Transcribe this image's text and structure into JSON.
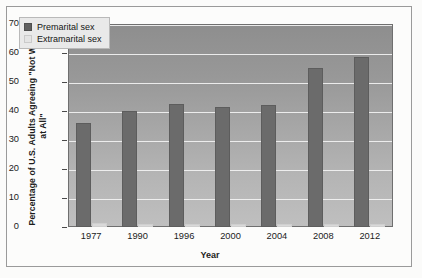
{
  "chart_data": {
    "type": "bar",
    "title": "",
    "xlabel": "Year",
    "ylabel": "Percentage of U.S. Adults Agreeing \"Not Wrong at All\"",
    "categories": [
      "1977",
      "1990",
      "1996",
      "2000",
      "2004",
      "2008",
      "2012"
    ],
    "series": [
      {
        "name": "Premarital sex",
        "color": "#6b6b6b",
        "values": [
          36,
          40,
          42.5,
          41.5,
          42,
          55,
          58.5
        ]
      },
      {
        "name": "Extramarital sex",
        "color": "#d9d9d9",
        "values": [
          1.5,
          1,
          1,
          1,
          1,
          1,
          1
        ]
      }
    ],
    "ylim": [
      0,
      70
    ],
    "yticks": [
      0,
      10,
      20,
      30,
      40,
      50,
      60,
      70
    ],
    "grid": true,
    "legend_position": "top-left"
  }
}
